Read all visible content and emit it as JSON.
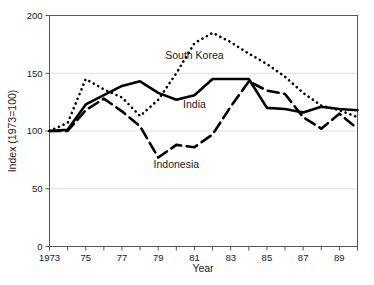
{
  "chart_data": {
    "type": "line",
    "title": "",
    "xlabel": "Year",
    "ylabel": "Index (1973=100)",
    "xlim": [
      1973,
      1990
    ],
    "ylim": [
      0,
      200
    ],
    "grid": true,
    "legend_position": "inline-annotations",
    "x": [
      1973,
      1974,
      1975,
      1976,
      1977,
      1978,
      1979,
      1980,
      1981,
      1982,
      1983,
      1984,
      1985,
      1986,
      1987,
      1988,
      1989,
      1990
    ],
    "xticks": [
      1973,
      1974,
      1975,
      1976,
      1977,
      1978,
      1979,
      1980,
      1981,
      1982,
      1983,
      1984,
      1985,
      1986,
      1987,
      1988,
      1989,
      1990
    ],
    "xticklabels": [
      "1973",
      "",
      "75",
      "",
      "77",
      "",
      "79",
      "",
      "81",
      "",
      "83",
      "",
      "85",
      "",
      "87",
      "",
      "89",
      ""
    ],
    "yticks": [
      0,
      50,
      100,
      150,
      200
    ],
    "yticklabels": [
      "0",
      "50",
      "100",
      "150",
      "200"
    ],
    "series": [
      {
        "name": "South Korea",
        "style": "dotted",
        "label_x": 1981,
        "label_y": 162,
        "values": [
          100,
          107,
          145,
          136,
          129,
          113,
          127,
          150,
          176,
          185,
          177,
          167,
          158,
          147,
          133,
          122,
          118,
          112
        ]
      },
      {
        "name": "India",
        "style": "solid",
        "label_x": 1981,
        "label_y": 120,
        "values": [
          100,
          101,
          123,
          131,
          139,
          143,
          133,
          127,
          131,
          145,
          145,
          145,
          120,
          119,
          116,
          121,
          119,
          118
        ]
      },
      {
        "name": "Indonesia",
        "style": "dashed",
        "label_x": 1980,
        "label_y": 68,
        "values": [
          100,
          100,
          118,
          128,
          117,
          104,
          77,
          88,
          86,
          97,
          121,
          143,
          135,
          132,
          112,
          102,
          115,
          102
        ]
      }
    ]
  },
  "axes": {
    "x_title": "Year",
    "y_title": "Index (1973=100)"
  }
}
